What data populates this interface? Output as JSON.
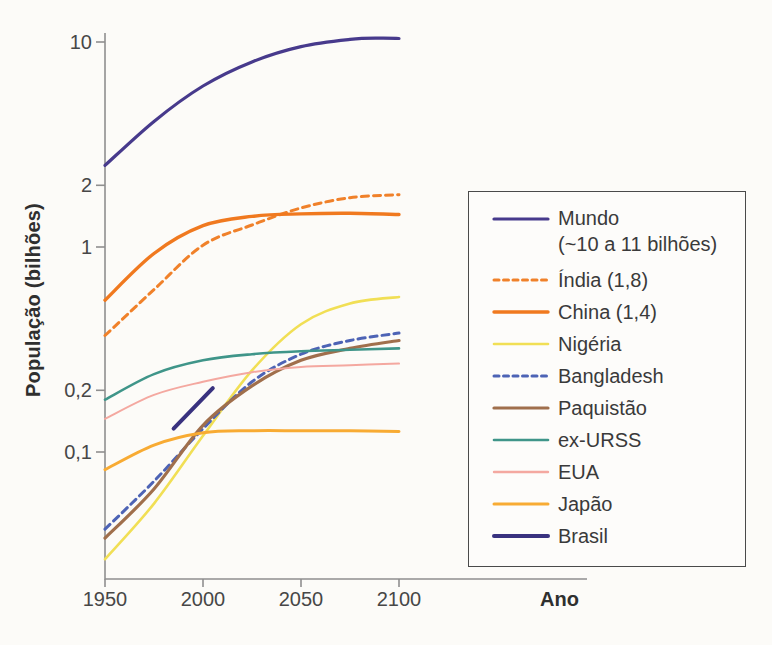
{
  "figure": {
    "background_color": "#fcfbf8",
    "axis_color": "#8f8f8f",
    "legend_border_color": "#4a4a4a"
  },
  "chart_data": {
    "type": "line",
    "title": "",
    "xlabel": "Ano",
    "ylabel": "População (bilhões)",
    "x_scale": "linear",
    "y_scale": "log",
    "xlim": [
      1950,
      2100
    ],
    "ylim": [
      0.025,
      12
    ],
    "grid": false,
    "legend_position": "right-outside",
    "x_ticks": [
      {
        "value": 1950,
        "label": "1950"
      },
      {
        "value": 2000,
        "label": "2000"
      },
      {
        "value": 2050,
        "label": "2050"
      },
      {
        "value": 2100,
        "label": "2100"
      }
    ],
    "y_ticks": [
      {
        "value": 10,
        "label": "10"
      },
      {
        "value": 2,
        "label": "2"
      },
      {
        "value": 1,
        "label": "1"
      },
      {
        "value": 0.2,
        "label": "0,2"
      },
      {
        "value": 0.1,
        "label": "0,1"
      }
    ],
    "series": [
      {
        "name": "Mundo",
        "legend_label": "Mundo",
        "legend_sublabel": "(~10 a 11 bilhões)",
        "color": "#473a8c",
        "dash": "",
        "width": 3.2,
        "x": [
          1950,
          1975,
          2000,
          2025,
          2050,
          2075,
          2090,
          2100
        ],
        "values": [
          2.5,
          4.1,
          6.1,
          8.0,
          9.5,
          10.3,
          10.45,
          10.4
        ]
      },
      {
        "name": "Índia",
        "legend_label": "Índia (1,8)",
        "legend_sublabel": "",
        "color": "#f0812a",
        "dash": "7 5",
        "width": 3,
        "x": [
          1950,
          1975,
          2000,
          2025,
          2050,
          2075,
          2100
        ],
        "values": [
          0.37,
          0.62,
          1.02,
          1.28,
          1.55,
          1.74,
          1.8
        ]
      },
      {
        "name": "China",
        "legend_label": "China (1,4)",
        "legend_sublabel": "",
        "color": "#f0791f",
        "dash": "",
        "width": 3.4,
        "x": [
          1950,
          1975,
          2000,
          2025,
          2050,
          2075,
          2100
        ],
        "values": [
          0.55,
          0.93,
          1.27,
          1.41,
          1.45,
          1.46,
          1.44
        ]
      },
      {
        "name": "Nigéria",
        "legend_label": "Nigéria",
        "legend_sublabel": "",
        "color": "#f1df55",
        "dash": "",
        "width": 2.6,
        "x": [
          1950,
          1975,
          2000,
          2025,
          2050,
          2075,
          2100
        ],
        "values": [
          0.03,
          0.056,
          0.12,
          0.25,
          0.42,
          0.53,
          0.57
        ]
      },
      {
        "name": "Bangladesh",
        "legend_label": "Bangladesh",
        "legend_sublabel": "",
        "color": "#4d63b5",
        "dash": "7 5",
        "width": 3,
        "x": [
          1950,
          1975,
          2000,
          2025,
          2050,
          2075,
          2100
        ],
        "values": [
          0.042,
          0.072,
          0.13,
          0.22,
          0.3,
          0.35,
          0.38
        ]
      },
      {
        "name": "Paquistão",
        "legend_label": "Paquistão",
        "legend_sublabel": "",
        "color": "#a06f4c",
        "dash": "",
        "width": 3.2,
        "x": [
          1950,
          1975,
          2000,
          2025,
          2050,
          2075,
          2100
        ],
        "values": [
          0.038,
          0.066,
          0.135,
          0.21,
          0.28,
          0.32,
          0.35
        ]
      },
      {
        "name": "ex-URSS",
        "legend_label": "ex-URSS",
        "legend_sublabel": "",
        "color": "#3f9589",
        "dash": "",
        "width": 2.6,
        "x": [
          1950,
          1975,
          2000,
          2025,
          2050,
          2075,
          2100
        ],
        "values": [
          0.18,
          0.24,
          0.28,
          0.3,
          0.31,
          0.315,
          0.32
        ]
      },
      {
        "name": "EUA",
        "legend_label": "EUA",
        "legend_sublabel": "",
        "color": "#f4a8a0",
        "dash": "",
        "width": 2,
        "x": [
          1950,
          1975,
          2000,
          2025,
          2050,
          2075,
          2100
        ],
        "values": [
          0.145,
          0.19,
          0.22,
          0.245,
          0.26,
          0.265,
          0.27
        ]
      },
      {
        "name": "Japão",
        "legend_label": "Japão",
        "legend_sublabel": "",
        "color": "#f8ab33",
        "dash": "",
        "width": 3,
        "x": [
          1950,
          1975,
          2000,
          2025,
          2050,
          2075,
          2100
        ],
        "values": [
          0.082,
          0.108,
          0.124,
          0.127,
          0.127,
          0.127,
          0.126
        ]
      },
      {
        "name": "Brasil",
        "legend_label": "Brasil",
        "legend_sublabel": "",
        "color": "#39327f",
        "dash": "",
        "width": 4,
        "x": [
          1985,
          2005
        ],
        "values": [
          0.13,
          0.205
        ]
      }
    ]
  }
}
